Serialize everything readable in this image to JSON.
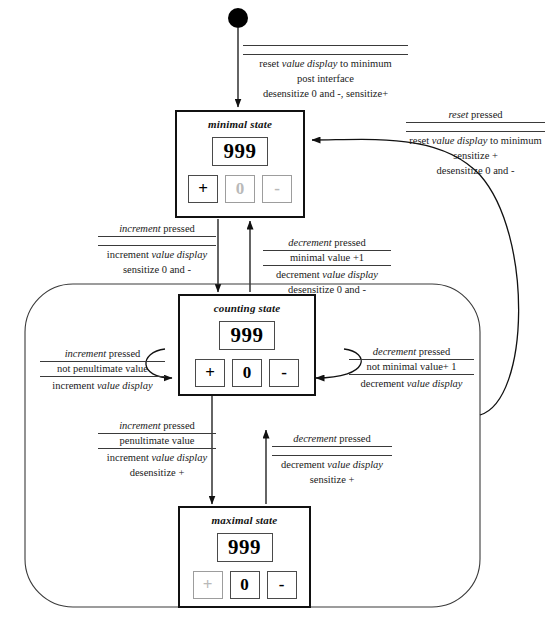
{
  "diagram": {
    "type": "uml-state-diagram",
    "initial_node": "filled-circle"
  },
  "states": {
    "minimal": {
      "name": "minimal state",
      "display_value": "999",
      "buttons": [
        {
          "label": "+",
          "enabled": true
        },
        {
          "label": "0",
          "enabled": false
        },
        {
          "label": "-",
          "enabled": false
        }
      ]
    },
    "counting": {
      "name": "counting state",
      "display_value": "999",
      "buttons": [
        {
          "label": "+",
          "enabled": true
        },
        {
          "label": "0",
          "enabled": true
        },
        {
          "label": "-",
          "enabled": true
        }
      ]
    },
    "maximal": {
      "name": "maximal state",
      "display_value": "999",
      "buttons": [
        {
          "label": "+",
          "enabled": false
        },
        {
          "label": "0",
          "enabled": true
        },
        {
          "label": "-",
          "enabled": true
        }
      ]
    }
  },
  "transitions": {
    "initial_to_minimal": {
      "trigger": "",
      "guard": "",
      "action_line1": "reset value display to minimum",
      "action_line2": "post interface",
      "action_line3": "desensitize 0 and -, sensitize+"
    },
    "minimal_to_counting": {
      "trigger": "increment pressed",
      "guard": "",
      "action_line1": "increment value display",
      "action_line2": "sensitize 0 and -"
    },
    "counting_to_minimal": {
      "trigger": "decrement pressed",
      "guard": "minimal value +1",
      "action_line1": "decrement value display",
      "action_line2": "desensitize 0 and -"
    },
    "counting_self_increment": {
      "trigger": "increment pressed",
      "guard": "not penultimate value",
      "action_line1": "increment value display"
    },
    "counting_self_decrement": {
      "trigger": "decrement pressed",
      "guard": "not minimal value+ 1",
      "action_line1": "decrement value display"
    },
    "counting_to_maximal": {
      "trigger": "increment pressed",
      "guard": "penultimate value",
      "action_line1": "increment value display",
      "action_line2": "desensitize +"
    },
    "maximal_to_counting": {
      "trigger": "decrement pressed",
      "guard": "",
      "action_line1": "decrement value display",
      "action_line2": "sensitize +"
    },
    "reset_to_minimal": {
      "trigger": "reset pressed",
      "guard": "",
      "action_line1": "reset value display to minimum",
      "action_line2": "sensitize +",
      "action_line3": "desensitize 0 and -"
    }
  },
  "colors": {
    "stroke": "#111111",
    "disabled": "#b9b9b9",
    "text": "#1a1a1a"
  }
}
